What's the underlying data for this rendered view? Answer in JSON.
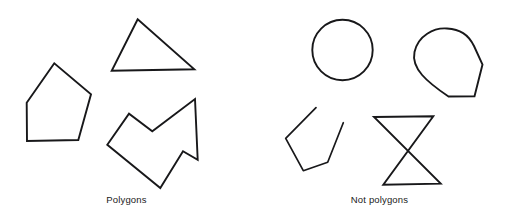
{
  "figure": {
    "width": 506,
    "height": 223,
    "background_color": "#ffffff",
    "stroke_color": "#18181a",
    "caption_color": "#1a1a1a"
  },
  "groups": [
    {
      "id": "polygons",
      "caption": "Polygons",
      "shapes": [
        {
          "name": "pentagon",
          "kind": "polygon",
          "closed": true,
          "points": "54.3,63.3 26.7,102.7 27,141 78.3,140 91,94.3"
        },
        {
          "name": "triangle",
          "kind": "polygon",
          "closed": true,
          "points": "137.7,19.3 111.7,70.7 194.3,69.3"
        },
        {
          "name": "concave-arrow-polygon",
          "kind": "polygon",
          "closed": true,
          "points": "107.3,144.7 129,113.7 152.3,131.3 195,99 197.7,159.7 183,151.3 160.3,188"
        }
      ]
    },
    {
      "id": "not-polygons",
      "caption": "Not polygons",
      "shapes": [
        {
          "name": "circle",
          "kind": "circle",
          "cx": 342.5,
          "cy": 50,
          "r": 30.2
        },
        {
          "name": "teardrop-blob",
          "kind": "path",
          "d": "M 448.5,96.5 C 427,82 411,68.5 414.5,52 C 418,35.5 434,27.5 447,28.5 C 460,29.5 468,34 474,46 L 482.5,64.5 L 474.5,96.2 Z"
        },
        {
          "name": "open-polyline",
          "kind": "polyline",
          "closed": false,
          "points": "316,107.7 285.7,138.3 303.3,170.7 327.7,162.3 343.3,122.7"
        },
        {
          "name": "bowtie-self-intersecting",
          "kind": "polygon",
          "closed": true,
          "points": "374,117 433.3,116.3 383.3,184.7 440.7,183.7"
        }
      ]
    }
  ]
}
